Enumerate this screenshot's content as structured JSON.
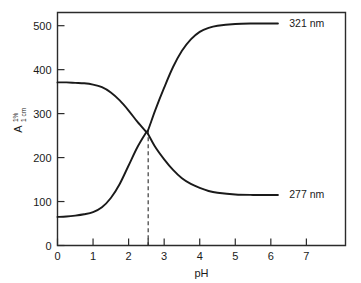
{
  "chart_data": {
    "type": "line",
    "title": "",
    "xlabel": "pH",
    "ylabel": "A",
    "ylabel_superscript": "1%",
    "ylabel_subscript": "1 cm",
    "xlim": [
      0,
      8.1
    ],
    "ylim": [
      0,
      530
    ],
    "xticks": [
      0,
      1,
      2,
      3,
      4,
      5,
      6,
      7
    ],
    "xtick_labels": [
      "0",
      "1",
      "2",
      "3",
      "4",
      "5",
      "6",
      "7"
    ],
    "yticks": [
      0,
      100,
      200,
      300,
      400,
      500
    ],
    "ytick_labels": [
      "0",
      "100",
      "200",
      "300",
      "400",
      "500"
    ],
    "extra_xticks": [
      2.55
    ],
    "grid": false,
    "legend_position": "right-inline",
    "series": [
      {
        "name": "321 nm",
        "label": "321 nm",
        "color": "#1a1a1a",
        "label_x": 6.35,
        "label_y": 505,
        "x": [
          0,
          0.25,
          0.5,
          0.75,
          1.0,
          1.25,
          1.5,
          1.75,
          2.0,
          2.25,
          2.5,
          2.55,
          2.75,
          3.0,
          3.25,
          3.5,
          3.75,
          4.0,
          4.25,
          4.5,
          5.0,
          5.5,
          6.0,
          6.2
        ],
        "y": [
          65,
          66,
          68,
          71,
          76,
          87,
          108,
          140,
          182,
          224,
          258,
          263,
          308,
          359,
          406,
          443,
          469,
          486,
          495,
          500,
          504,
          505,
          505,
          505
        ]
      },
      {
        "name": "277 nm",
        "label": "277 nm",
        "color": "#1a1a1a",
        "label_x": 6.35,
        "label_y": 117,
        "x": [
          0,
          0.25,
          0.5,
          0.75,
          1.0,
          1.25,
          1.5,
          1.75,
          2.0,
          2.25,
          2.5,
          2.55,
          2.75,
          3.0,
          3.25,
          3.5,
          3.75,
          4.0,
          4.25,
          4.5,
          5.0,
          5.5,
          6.0,
          6.2
        ],
        "y": [
          371,
          371,
          370,
          369,
          366,
          360,
          348,
          330,
          307,
          281,
          258,
          253,
          224,
          196,
          172,
          153,
          140,
          131,
          124,
          120,
          116,
          115,
          115,
          115
        ]
      }
    ],
    "annotations": [
      {
        "type": "vertical-dashed-line",
        "name": "isosbestic-guide-line",
        "x": 2.55,
        "y_top": 262,
        "y_bottom": 0
      }
    ]
  }
}
